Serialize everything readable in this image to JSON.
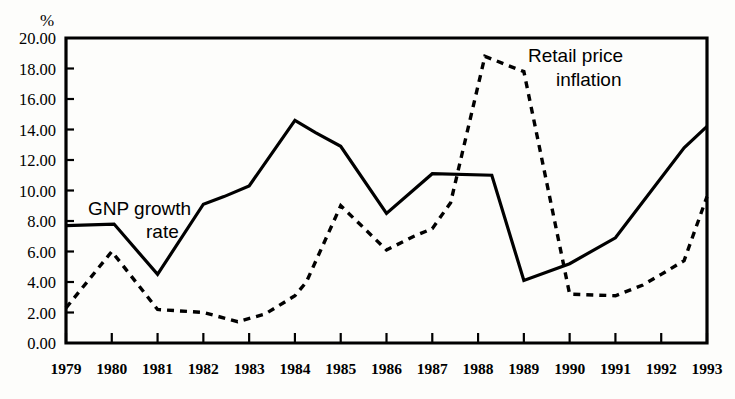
{
  "chart_data": {
    "type": "line",
    "title": "",
    "subtitle": "",
    "xlabel": "",
    "ylabel": "%",
    "ylim": [
      0,
      20
    ],
    "xlim": [
      1979,
      1993
    ],
    "grid": false,
    "legend_position": "inline-annotation",
    "y_ticks": [
      "0.00",
      "2.00",
      "4.00",
      "6.00",
      "8.00",
      "10.00",
      "12.00",
      "14.00",
      "16.00",
      "18.00",
      "20.00"
    ],
    "y_tick_values": [
      0,
      2,
      4,
      6,
      8,
      10,
      12,
      14,
      16,
      18,
      20
    ],
    "categories": [
      "1979",
      "1980",
      "1981",
      "1982",
      "1983",
      "1984",
      "1985",
      "1986",
      "1987",
      "1988",
      "1989",
      "1990",
      "1991",
      "1992",
      "1993"
    ],
    "x": [
      1979,
      1980,
      1981,
      1982,
      1983,
      1984,
      1985,
      1986,
      1987,
      1988,
      1989,
      1990,
      1991,
      1992,
      1993
    ],
    "series": [
      {
        "name": "GNP growth rate",
        "style": "solid",
        "label_line_1": "GNP growth",
        "label_line_2": "rate",
        "values": [
          7.7,
          7.8,
          4.5,
          9.1,
          10.3,
          14.6,
          12.9,
          8.5,
          11.1,
          11.0,
          4.1,
          5.2,
          6.9,
          12.8,
          14.2
        ],
        "vertices": [
          {
            "x": 1979.0,
            "y": 7.7
          },
          {
            "x": 1980.05,
            "y": 7.8
          },
          {
            "x": 1981.0,
            "y": 4.5
          },
          {
            "x": 1982.0,
            "y": 9.1
          },
          {
            "x": 1982.45,
            "y": 9.6
          },
          {
            "x": 1983.0,
            "y": 10.3
          },
          {
            "x": 1984.0,
            "y": 14.6
          },
          {
            "x": 1984.45,
            "y": 13.8
          },
          {
            "x": 1985.0,
            "y": 12.9
          },
          {
            "x": 1986.0,
            "y": 8.5
          },
          {
            "x": 1987.0,
            "y": 11.1
          },
          {
            "x": 1988.3,
            "y": 11.0
          },
          {
            "x": 1989.0,
            "y": 4.1
          },
          {
            "x": 1990.0,
            "y": 5.2
          },
          {
            "x": 1991.0,
            "y": 6.9
          },
          {
            "x": 1992.5,
            "y": 12.8
          },
          {
            "x": 1993.0,
            "y": 14.2
          }
        ]
      },
      {
        "name": "Retail price inflation",
        "style": "dashed",
        "label_line_1": "Retail price",
        "label_line_2": "inflation",
        "values": [
          2.3,
          6.0,
          2.2,
          2.0,
          1.4,
          3.1,
          9.0,
          6.1,
          7.5,
          18.8,
          17.8,
          3.2,
          3.1,
          5.4,
          9.6
        ],
        "vertices": [
          {
            "x": 1979.0,
            "y": 2.3
          },
          {
            "x": 1980.0,
            "y": 6.0
          },
          {
            "x": 1981.0,
            "y": 2.2
          },
          {
            "x": 1982.0,
            "y": 2.0
          },
          {
            "x": 1982.75,
            "y": 1.4
          },
          {
            "x": 1983.35,
            "y": 1.9
          },
          {
            "x": 1984.0,
            "y": 3.1
          },
          {
            "x": 1984.25,
            "y": 4.0
          },
          {
            "x": 1985.0,
            "y": 9.0
          },
          {
            "x": 1985.45,
            "y": 7.7
          },
          {
            "x": 1986.0,
            "y": 6.1
          },
          {
            "x": 1986.6,
            "y": 7.0
          },
          {
            "x": 1987.0,
            "y": 7.5
          },
          {
            "x": 1987.4,
            "y": 9.2
          },
          {
            "x": 1988.15,
            "y": 18.8
          },
          {
            "x": 1988.65,
            "y": 18.2
          },
          {
            "x": 1989.0,
            "y": 17.8
          },
          {
            "x": 1989.85,
            "y": 5.4
          },
          {
            "x": 1990.0,
            "y": 3.2
          },
          {
            "x": 1991.0,
            "y": 3.1
          },
          {
            "x": 1991.6,
            "y": 3.8
          },
          {
            "x": 1992.0,
            "y": 4.5
          },
          {
            "x": 1992.5,
            "y": 5.4
          },
          {
            "x": 1993.0,
            "y": 9.6
          }
        ]
      }
    ]
  },
  "annotations": {
    "gnp_label_line_1": "GNP growth",
    "gnp_label_line_2": "rate",
    "rpi_label_line_1": "Retail price",
    "rpi_label_line_2": "inflation",
    "unit_label": "%"
  },
  "colors": {
    "ink": "#000000",
    "paper": "#fdfdfb"
  }
}
